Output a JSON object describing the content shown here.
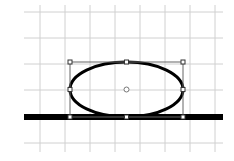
{
  "canvas": {
    "background": "#ffffff",
    "grid_color": "#d0d0d0",
    "grid": {
      "x_lines": [
        40,
        65,
        90,
        115,
        140,
        165,
        190,
        215
      ],
      "y_lines": [
        12,
        38,
        64,
        90,
        116,
        143
      ],
      "x_start": 24,
      "x_end": 223,
      "y_start": 5,
      "y_end": 152
    }
  },
  "baseline": {
    "x1": 24,
    "x2": 223,
    "y": 117,
    "thickness": 6,
    "color": "#000000"
  },
  "ellipse": {
    "cx": 126.5,
    "cy": 89.5,
    "rx": 56.5,
    "ry": 27.5,
    "stroke": "#000000",
    "stroke_width": 3
  },
  "selection": {
    "x": 70,
    "y": 62,
    "width": 113,
    "height": 55,
    "frame_color": "#666666",
    "handles": [
      {
        "x": 70,
        "y": 62
      },
      {
        "x": 126.5,
        "y": 62
      },
      {
        "x": 183,
        "y": 62
      },
      {
        "x": 70,
        "y": 89.5
      },
      {
        "x": 183,
        "y": 89.5
      },
      {
        "x": 70,
        "y": 117
      },
      {
        "x": 126.5,
        "y": 117
      },
      {
        "x": 183,
        "y": 117
      }
    ],
    "center_marker": {
      "x": 126.5,
      "y": 89.5,
      "r": 2.5
    }
  }
}
